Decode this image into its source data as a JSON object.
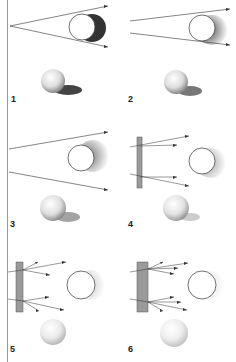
{
  "figure": {
    "panels": [
      {
        "label": "1",
        "type": "point-source-converging",
        "diffuser": "none"
      },
      {
        "label": "2",
        "type": "wider-source",
        "diffuser": "none"
      },
      {
        "label": "3",
        "type": "broad-source",
        "diffuser": "none"
      },
      {
        "label": "4",
        "type": "thin-diffuser",
        "diffuser": "thin"
      },
      {
        "label": "5",
        "type": "medium-diffuser",
        "diffuser": "medium"
      },
      {
        "label": "6",
        "type": "thick-diffuser",
        "diffuser": "thick"
      }
    ]
  },
  "colors": {
    "line": "#333333",
    "diffuser": "#9a9a9a",
    "shadow": "#3a3a3a",
    "border": "#9a9a9a"
  }
}
